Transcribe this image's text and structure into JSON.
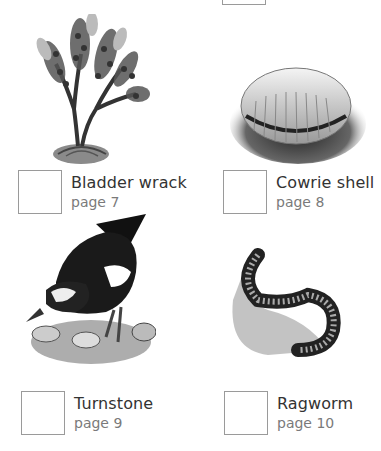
{
  "top_partial": {
    "checkbox": true
  },
  "items": [
    {
      "name": "Bladder wrack",
      "page": "page 7",
      "illustration": "bladder-wrack-seaweed"
    },
    {
      "name": "Cowrie shell",
      "page": "page 8",
      "illustration": "cowrie-shell"
    },
    {
      "name": "Turnstone",
      "page": "page 9",
      "illustration": "turnstone-bird"
    },
    {
      "name": "Ragworm",
      "page": "page 10",
      "illustration": "ragworm"
    }
  ],
  "colors": {
    "box_border": "#9a9a9a",
    "title_text": "#333333",
    "page_text": "#7a7a7a"
  }
}
